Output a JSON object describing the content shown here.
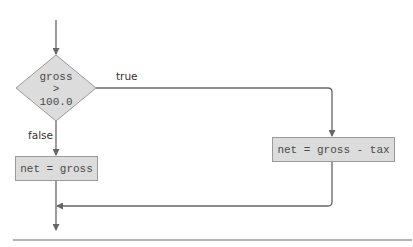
{
  "diagram": {
    "type": "flowchart",
    "decision": {
      "lines": [
        "gross",
        ">",
        "100.0"
      ]
    },
    "branches": {
      "true_label": "true",
      "false_label": "false"
    },
    "process_false": {
      "label": "net = gross"
    },
    "process_true": {
      "label": "net = gross - tax"
    },
    "colors": {
      "shape_fill": "#dcdcdc",
      "shape_stroke": "#9a9a9a",
      "line": "#666666",
      "text": "#4a4a4a"
    }
  }
}
